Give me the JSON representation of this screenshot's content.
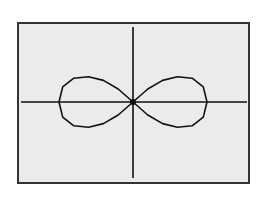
{
  "chart_data": {
    "type": "line",
    "title": "",
    "xlabel": "",
    "ylabel": "",
    "grid": false,
    "legend": null,
    "series": [
      {
        "name": "lemniscate",
        "x": [
          -1.0,
          -0.95,
          -0.8,
          -0.6,
          -0.4,
          -0.2,
          0.0,
          0.2,
          0.4,
          0.6,
          0.8,
          0.95,
          1.0,
          0.95,
          0.8,
          0.6,
          0.4,
          0.2,
          0.0,
          -0.2,
          -0.4,
          -0.6,
          -0.8,
          -0.95,
          -1.0
        ],
        "y": [
          0.0,
          0.21,
          0.33,
          0.35,
          0.3,
          0.18,
          0.0,
          -0.18,
          -0.3,
          -0.35,
          -0.33,
          -0.21,
          0.0,
          0.21,
          0.33,
          0.35,
          0.3,
          0.18,
          0.0,
          -0.18,
          -0.3,
          -0.35,
          -0.33,
          -0.21,
          0.0
        ]
      }
    ],
    "xlim": [
      -1.2,
      1.2
    ],
    "ylim": [
      -0.9,
      0.9
    ],
    "colors": {
      "background": "#ebebeb",
      "border": "#333333",
      "curve": "#111111",
      "axes": "#111111"
    }
  }
}
